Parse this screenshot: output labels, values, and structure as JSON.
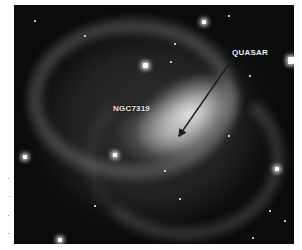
{
  "figure": {
    "labels": {
      "galaxy": "NGC7319",
      "quasar": "QUASAR"
    },
    "colors": {
      "background": "#0b0b0b",
      "label_text": "#f2f2f2",
      "arrow": "#222222",
      "page": "#ffffff"
    }
  }
}
